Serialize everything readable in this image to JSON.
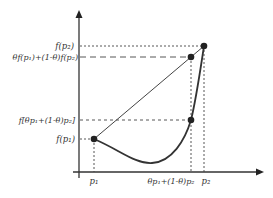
{
  "diagram": {
    "colors": {
      "stroke": "#333333",
      "background": "#ffffff"
    },
    "y_labels": {
      "f_p2": "f(p₂)",
      "combo": "θf(p₁)+(1-θ)f(p₂)",
      "f_combo": "f[θp₁+(1-θ)p₂]",
      "f_p1": "f(p₁)"
    },
    "x_labels": {
      "p1": "p₁",
      "combo": "θp₁+(1-θ)p₂",
      "p2": "p₂"
    }
  }
}
